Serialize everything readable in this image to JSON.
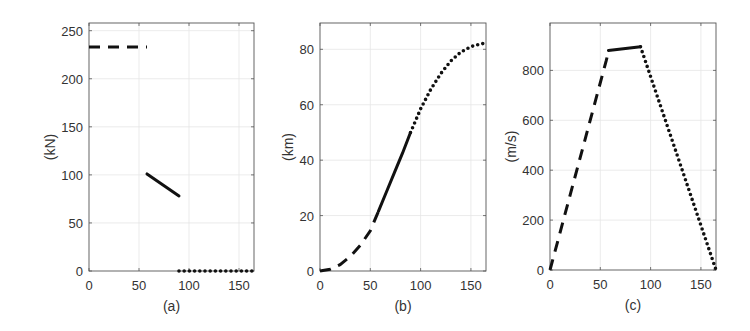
{
  "chart_data": [
    {
      "type": "line",
      "panel": "(a)",
      "title": "",
      "xlabel": "(a)",
      "ylabel": "(kN)",
      "xlim": [
        0,
        165
      ],
      "ylim": [
        0,
        258
      ],
      "xticks": [
        0,
        50,
        100,
        150
      ],
      "yticks": [
        0,
        50,
        100,
        150,
        200,
        250
      ],
      "grid": true,
      "frame": {
        "left": 89,
        "right": 254,
        "top": 23,
        "bottom": 271
      },
      "series": [
        {
          "name": "phase-1",
          "style": "dashed",
          "x": [
            0,
            58
          ],
          "y": [
            233,
            233
          ]
        },
        {
          "name": "phase-2",
          "style": "solid",
          "x": [
            58,
            90
          ],
          "y": [
            101,
            78
          ]
        },
        {
          "name": "phase-3",
          "style": "dotted",
          "x": [
            90,
            165
          ],
          "y": [
            0,
            0
          ]
        }
      ]
    },
    {
      "type": "line",
      "panel": "(b)",
      "title": "",
      "xlabel": "(b)",
      "ylabel": "(km)",
      "xlim": [
        0,
        165
      ],
      "ylim": [
        0,
        89.5
      ],
      "xticks": [
        0,
        50,
        100,
        150
      ],
      "yticks": [
        0,
        20,
        40,
        60,
        80
      ],
      "grid": true,
      "frame": {
        "left": 320,
        "right": 486,
        "top": 23,
        "bottom": 271
      },
      "series": [
        {
          "name": "phase-1",
          "style": "dashed",
          "x": [
            0,
            10,
            20,
            30,
            40,
            50,
            58
          ],
          "y": [
            0,
            0.6,
            2.3,
            5.2,
            9.2,
            14.5,
            21.5
          ]
        },
        {
          "name": "phase-2",
          "style": "solid",
          "x": [
            58,
            66,
            74,
            82,
            90
          ],
          "y": [
            21.5,
            28.5,
            35.5,
            42.5,
            50
          ]
        },
        {
          "name": "phase-3",
          "style": "dotted",
          "x": [
            90,
            100,
            110,
            120,
            130,
            140,
            150,
            160,
            165
          ],
          "y": [
            50,
            58.5,
            65.5,
            71.2,
            75.8,
            79.0,
            81.0,
            82.0,
            82.2
          ]
        }
      ]
    },
    {
      "type": "line",
      "panel": "(c)",
      "title": "",
      "xlabel": "(c)",
      "ylabel": "(m/s)",
      "xlim": [
        0,
        165
      ],
      "ylim": [
        0,
        990
      ],
      "xticks": [
        0,
        50,
        100,
        150
      ],
      "yticks": [
        0,
        200,
        400,
        600,
        800
      ],
      "grid": true,
      "frame": {
        "left": 550,
        "right": 716,
        "top": 23,
        "bottom": 270
      },
      "series": [
        {
          "name": "phase-1",
          "style": "dashed",
          "x": [
            0,
            56,
            58
          ],
          "y": [
            0,
            840,
            875
          ]
        },
        {
          "name": "phase-2",
          "style": "solid",
          "x": [
            58,
            90
          ],
          "y": [
            880,
            895
          ]
        },
        {
          "name": "phase-3",
          "style": "dotted",
          "x": [
            90,
            165
          ],
          "y": [
            895,
            0
          ]
        }
      ]
    }
  ]
}
